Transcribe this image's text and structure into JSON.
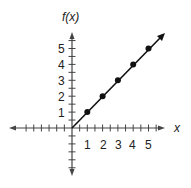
{
  "chart_data": {
    "type": "line",
    "title": "",
    "xlabel": "x",
    "ylabel": "f(x)",
    "x": [
      1,
      2,
      3,
      4,
      5
    ],
    "series": [
      {
        "name": "f(x)",
        "values": [
          1,
          2,
          3,
          4,
          5
        ],
        "markers": true,
        "extends_with_arrow": true,
        "starts_at_origin": true
      }
    ],
    "x_tick_labels": [
      "1",
      "2",
      "3",
      "4",
      "5"
    ],
    "y_tick_labels": [
      "1",
      "2",
      "3",
      "4",
      "5"
    ],
    "xlim": [
      -3,
      6
    ],
    "ylim": [
      -3,
      6
    ],
    "minor_tick_step": 0.5,
    "grid": false,
    "legend": "none",
    "colors": {
      "line": "#111111",
      "axis": "#444444",
      "text": "#222222"
    }
  },
  "labels": {
    "y_axis": "f(x)",
    "x_axis": "x",
    "x_ticks": [
      "1",
      "2",
      "3",
      "4",
      "5"
    ],
    "y_ticks": [
      "1",
      "2",
      "3",
      "4",
      "5"
    ]
  }
}
